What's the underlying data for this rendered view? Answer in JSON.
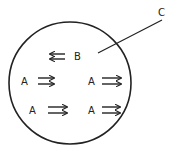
{
  "diagram": {
    "boundary": {
      "label": "C",
      "shape": "circle"
    },
    "particles": [
      {
        "label": "B",
        "arrow_direction": "left"
      },
      {
        "label": "A",
        "arrow_direction": "right"
      },
      {
        "label": "A",
        "arrow_direction": "right"
      },
      {
        "label": "A",
        "arrow_direction": "right"
      },
      {
        "label": "A",
        "arrow_direction": "right"
      }
    ]
  },
  "colors": {
    "stroke": "#222222",
    "background": "#ffffff"
  }
}
